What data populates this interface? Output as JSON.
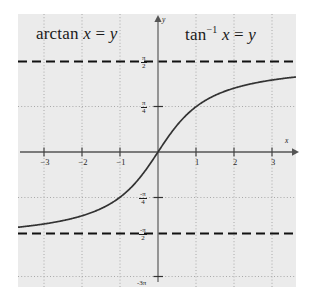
{
  "figure": {
    "kind": "math-function-graph",
    "background_color": "#ffffff",
    "plot_background_color": "#ebebeb",
    "curve_color": "#333333",
    "axis_color": "#555555",
    "grid_color": "#aaaaaa",
    "asymptote_color": "#111111"
  },
  "annotations": {
    "left_title": {
      "full_text": "arctan x = y",
      "function_name": "arctan",
      "variable_x": "x",
      "equals": "=",
      "variable_y": "y"
    },
    "right_title": {
      "full_text": "tan−1 x = y",
      "function_name": "tan",
      "exponent": "−1",
      "variable_x": "x",
      "equals": "=",
      "variable_y": "y"
    }
  },
  "axes": {
    "x_axis_name": "x",
    "y_axis_name": "y",
    "x_ticks": [
      {
        "label": "−3",
        "value": -3
      },
      {
        "label": "−2",
        "value": -2
      },
      {
        "label": "−1",
        "value": -1
      },
      {
        "label": "1",
        "value": 1
      },
      {
        "label": "2",
        "value": 2
      },
      {
        "label": "3",
        "value": 3
      }
    ],
    "y_ticks": [
      {
        "label": "π/2",
        "numerator": "π",
        "denominator": "2",
        "value": 1.5708
      },
      {
        "label": "π/4",
        "numerator": "π",
        "denominator": "4",
        "value": 0.7854
      },
      {
        "label": "-π/4",
        "numerator": "-π",
        "denominator": "4",
        "value": -0.7854
      },
      {
        "label": "-π/2",
        "numerator": "-π",
        "denominator": "2",
        "value": -1.5708
      },
      {
        "label": "-3π",
        "numerator": "-3π",
        "denominator": "",
        "value": -2.9
      }
    ]
  },
  "chart_data": {
    "type": "line",
    "xlabel": "x",
    "ylabel": "y",
    "xlim": [
      -3.75,
      3.9
    ],
    "ylim": [
      -2.95,
      2.05
    ],
    "grid": true,
    "legend_position": "none",
    "xticks": [
      -3,
      -2,
      -1,
      1,
      2,
      3
    ],
    "xticklabels": [
      "−3",
      "−2",
      "−1",
      "1",
      "2",
      "3"
    ],
    "yticks": [
      1.5708,
      0.7854,
      -0.7854,
      -1.5708,
      -2.9
    ],
    "yticklabels": [
      "π/2",
      "π/4",
      "-π/4",
      "-π/2",
      "-3π"
    ],
    "series": [
      {
        "name": "y = arctan(x)",
        "style": "solid",
        "color": "#333333",
        "x": [
          -3.75,
          -3.5,
          -3.25,
          -3.0,
          -2.75,
          -2.5,
          -2.25,
          -2.0,
          -1.75,
          -1.5,
          -1.25,
          -1.0,
          -0.75,
          -0.5,
          -0.25,
          0.0,
          0.25,
          0.5,
          0.75,
          1.0,
          1.25,
          1.5,
          1.75,
          2.0,
          2.25,
          2.5,
          2.75,
          3.0,
          3.25,
          3.5,
          3.75
        ],
        "y": [
          -1.3102,
          -1.2925,
          -1.2723,
          -1.249,
          -1.222,
          -1.1903,
          -1.1526,
          -1.1071,
          -1.0517,
          -0.9828,
          -0.8961,
          -0.7854,
          -0.6435,
          -0.4636,
          -0.245,
          0.0,
          0.245,
          0.4636,
          0.6435,
          0.7854,
          0.8961,
          0.9828,
          1.0517,
          1.1071,
          1.1526,
          1.1903,
          1.222,
          1.249,
          1.2723,
          1.2925,
          1.3102
        ]
      },
      {
        "name": "asymptote y = π/2",
        "style": "dashed",
        "color": "#111111",
        "value": 1.5708
      },
      {
        "name": "asymptote y = -π/2",
        "style": "dashed",
        "color": "#111111",
        "value": -1.5708
      }
    ]
  }
}
